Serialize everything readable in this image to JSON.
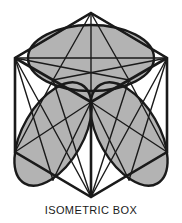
{
  "figure": {
    "title": "ISOMETRIC BOX",
    "caption": "ISOMETRIC BOX",
    "type": "isometric-cube-with-inscribed-ellipses",
    "background_color": "#ffffff",
    "stroke_color": "#1a1a1a",
    "fill_color": "#b3b3b3",
    "stroke_width": 2.2,
    "thin_stroke_width": 1.4,
    "canvas": {
      "width": 182,
      "height": 223
    },
    "geometry": {
      "center": {
        "x": 91,
        "y": 112
      },
      "vertices": {
        "top": {
          "x": 91,
          "y": 13
        },
        "upper_left": {
          "x": 15,
          "y": 58
        },
        "upper_right": {
          "x": 167,
          "y": 58
        },
        "lower_left": {
          "x": 15,
          "y": 152
        },
        "lower_right": {
          "x": 167,
          "y": 152
        },
        "bottom": {
          "x": 91,
          "y": 197
        }
      },
      "faces": [
        {
          "name": "top-face",
          "label": "Top rhombus face",
          "ellipse": {
            "cx": 91,
            "cy": 58,
            "rx": 63,
            "ry": 33,
            "rotation": 0
          }
        },
        {
          "name": "left-face",
          "label": "Left rhombus face",
          "ellipse": {
            "cx": 53,
            "cy": 134,
            "rx": 57,
            "ry": 30,
            "rotation": -60
          }
        },
        {
          "name": "right-face",
          "label": "Right rhombus face",
          "ellipse": {
            "cx": 129,
            "cy": 134,
            "rx": 57,
            "ry": 30,
            "rotation": 60
          }
        }
      ]
    }
  }
}
